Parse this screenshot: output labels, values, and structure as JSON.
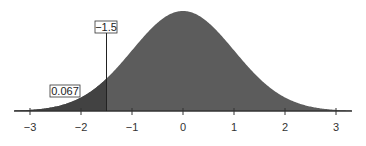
{
  "chart_data": {
    "type": "area",
    "title": "",
    "xlabel": "",
    "ylabel": "",
    "distribution": "standard normal",
    "mean": 0,
    "sd": 1,
    "xlim": [
      -3.3,
      3.3
    ],
    "x_ticks": [
      -3,
      -2,
      -1,
      0,
      1,
      2,
      3
    ],
    "x_tick_labels": [
      "−3",
      "−2",
      "−1",
      "0",
      "1",
      "2",
      "3"
    ],
    "grid": false,
    "legend": null,
    "shaded_region": {
      "from": "-inf",
      "to": -1.5,
      "area": 0.067
    },
    "annotations": [
      {
        "text": "−1.5",
        "x": -1.5,
        "role": "cutoff z-value"
      },
      {
        "text": "0.067",
        "role": "left-tail area"
      }
    ],
    "colors": {
      "curve_fill": "#5a5a5a",
      "tail_fill": "#404040",
      "axis": "#333333"
    }
  },
  "labels": {
    "cutoff": "−1.5",
    "tail_area": "0.067",
    "ticks": [
      "−3",
      "−2",
      "−1",
      "0",
      "1",
      "2",
      "3"
    ]
  }
}
